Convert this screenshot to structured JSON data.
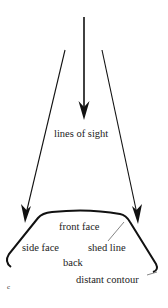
{
  "diagram": {
    "labels": {
      "lines_of_sight": "lines of sight",
      "front_face": "front face",
      "side_face": "side face",
      "shed_line": "shed line",
      "back": "back",
      "distant_contour": "distant contour",
      "panel_letter": "c"
    },
    "colors": {
      "stroke": "#111111",
      "text": "#222222",
      "background": "#ffffff"
    }
  }
}
